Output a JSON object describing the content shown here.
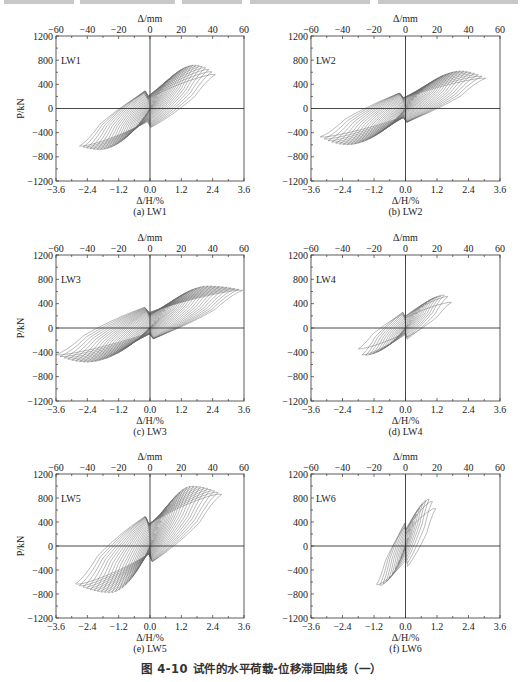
{
  "figure_caption": "图 4-10   试件的水平荷载-位移滞回曲线（一）",
  "chart_data": [
    {
      "type": "line",
      "subtype": "hysteresis",
      "panel_label": "(a) LW1",
      "specimen": "LW1",
      "xlabel": "Δ/H/%",
      "x2label": "Δ/mm",
      "ylabel": "P/kN",
      "xlim": [
        -3.6,
        3.6
      ],
      "x2lim": [
        -60,
        60
      ],
      "ylim": [
        -1200,
        1200
      ],
      "xticks": [
        "-3.6",
        "-2.4",
        "-1.2",
        "0.0",
        "1.2",
        "2.4",
        "3.6"
      ],
      "x2ticks": [
        "-60",
        "-40",
        "-20",
        "0",
        "20",
        "40",
        "60"
      ],
      "yticks": [
        "1200",
        "800",
        "400",
        "0",
        "-400",
        "-800",
        "-1200"
      ],
      "envelope": {
        "pos_drift_max": 2.5,
        "pos_peak_drift": 1.7,
        "pos_peak_load": 720,
        "pos_end_load": 560,
        "neg_drift_max": -2.7,
        "neg_peak_drift": -1.9,
        "neg_peak_load": -680,
        "neg_end_load": -620
      },
      "cycles": 22,
      "pinching": 0.55
    },
    {
      "type": "line",
      "subtype": "hysteresis",
      "panel_label": "(b) LW2",
      "specimen": "LW2",
      "xlabel": "Δ/H/%",
      "x2label": "Δ/mm",
      "ylabel": "P/kN",
      "xlim": [
        -3.6,
        3.6
      ],
      "x2lim": [
        -60,
        60
      ],
      "ylim": [
        -1200,
        1200
      ],
      "xticks": [
        "-3.6",
        "-2.4",
        "-1.2",
        "0.0",
        "1.2",
        "2.4",
        "3.6"
      ],
      "x2ticks": [
        "-60",
        "-40",
        "-20",
        "0",
        "20",
        "40",
        "60"
      ],
      "yticks": [
        "1200",
        "800",
        "400",
        "0",
        "-400",
        "-800",
        "-1200"
      ],
      "envelope": {
        "pos_drift_max": 3.05,
        "pos_peak_drift": 2.1,
        "pos_peak_load": 620,
        "pos_end_load": 500,
        "neg_drift_max": -3.25,
        "neg_peak_drift": -2.2,
        "neg_peak_load": -600,
        "neg_end_load": -470
      },
      "cycles": 24,
      "pinching": 0.6
    },
    {
      "type": "line",
      "subtype": "hysteresis",
      "panel_label": "(c) LW3",
      "specimen": "LW3",
      "xlabel": "Δ/H/%",
      "x2label": "Δ/mm",
      "ylabel": "P/kN",
      "xlim": [
        -3.6,
        3.6
      ],
      "x2lim": [
        -60,
        60
      ],
      "ylim": [
        -1200,
        1200
      ],
      "xticks": [
        "-3.6",
        "-2.4",
        "-1.2",
        "0.0",
        "1.2",
        "2.4",
        "3.6"
      ],
      "x2ticks": [
        "-60",
        "-40",
        "-20",
        "0",
        "20",
        "40",
        "60"
      ],
      "yticks": [
        "1200",
        "800",
        "400",
        "0",
        "-400",
        "-800",
        "-1200"
      ],
      "envelope": {
        "pos_drift_max": 3.55,
        "pos_peak_drift": 2.2,
        "pos_peak_load": 690,
        "pos_end_load": 620,
        "neg_drift_max": -3.6,
        "neg_peak_drift": -2.4,
        "neg_peak_load": -560,
        "neg_end_load": -440
      },
      "cycles": 26,
      "pinching": 0.6
    },
    {
      "type": "line",
      "subtype": "hysteresis",
      "panel_label": "(d) LW4",
      "specimen": "LW4",
      "xlabel": "Δ/H/%",
      "x2label": "Δ/mm",
      "ylabel": "P/kN",
      "xlim": [
        -3.6,
        3.6
      ],
      "x2lim": [
        -60,
        60
      ],
      "ylim": [
        -1200,
        1200
      ],
      "xticks": [
        "-3.6",
        "-2.4",
        "-1.2",
        "0.0",
        "1.2",
        "2.4",
        "3.6"
      ],
      "x2ticks": [
        "-60",
        "-40",
        "-20",
        "0",
        "20",
        "40",
        "60"
      ],
      "yticks": [
        "1200",
        "800",
        "400",
        "0",
        "-400",
        "-800",
        "-1200"
      ],
      "envelope": {
        "pos_drift_max": 1.75,
        "pos_peak_drift": 1.5,
        "pos_peak_load": 540,
        "pos_end_load": 420,
        "neg_drift_max": -1.8,
        "neg_peak_drift": -1.6,
        "neg_peak_load": -450,
        "neg_end_load": -340
      },
      "cycles": 14,
      "pinching": 0.5
    },
    {
      "type": "line",
      "subtype": "hysteresis",
      "panel_label": "(e) LW5",
      "specimen": "LW5",
      "xlabel": "Δ/H/%",
      "x2label": "Δ/mm",
      "ylabel": "P/kN",
      "xlim": [
        -3.6,
        3.6
      ],
      "x2lim": [
        -60,
        60
      ],
      "ylim": [
        -1200,
        1200
      ],
      "xticks": [
        "-3.6",
        "-2.4",
        "-1.2",
        "0.0",
        "1.2",
        "2.4",
        "3.6"
      ],
      "x2ticks": [
        "-60",
        "-40",
        "-20",
        "0",
        "20",
        "40",
        "60"
      ],
      "yticks": [
        "1200",
        "800",
        "400",
        "0",
        "-400",
        "-800",
        "-1200"
      ],
      "envelope": {
        "pos_drift_max": 2.75,
        "pos_peak_drift": 1.6,
        "pos_peak_load": 1000,
        "pos_end_load": 860,
        "neg_drift_max": -2.85,
        "neg_peak_drift": -1.5,
        "neg_peak_load": -780,
        "neg_end_load": -630
      },
      "cycles": 22,
      "pinching": 0.45
    },
    {
      "type": "line",
      "subtype": "hysteresis",
      "panel_label": "(f) LW6",
      "specimen": "LW6",
      "xlabel": "Δ/H/%",
      "x2label": "Δ/mm",
      "ylabel": "P/kN",
      "xlim": [
        -3.6,
        3.6
      ],
      "x2lim": [
        -60,
        60
      ],
      "ylim": [
        -1200,
        1200
      ],
      "xticks": [
        "-3.6",
        "-2.4",
        "-1.2",
        "0.0",
        "1.2",
        "2.4",
        "3.6"
      ],
      "x2ticks": [
        "-60",
        "-40",
        "-20",
        "0",
        "20",
        "40",
        "60"
      ],
      "yticks": [
        "1200",
        "800",
        "400",
        "0",
        "-400",
        "-800",
        "-1200"
      ],
      "envelope": {
        "pos_drift_max": 1.15,
        "pos_peak_drift": 0.9,
        "pos_peak_load": 780,
        "pos_end_load": 620,
        "neg_drift_max": -1.1,
        "neg_peak_drift": -1.05,
        "neg_peak_load": -660,
        "neg_end_load": -640
      },
      "cycles": 10,
      "pinching": 0.35
    }
  ],
  "layout": {
    "panels": [
      {
        "left": 56,
        "top": 36,
        "width": 188,
        "height": 145
      },
      {
        "left": 311,
        "top": 36,
        "width": 189,
        "height": 145
      },
      {
        "left": 56,
        "top": 255,
        "width": 188,
        "height": 146
      },
      {
        "left": 311,
        "top": 255,
        "width": 189,
        "height": 146
      },
      {
        "left": 56,
        "top": 474,
        "width": 188,
        "height": 144
      },
      {
        "left": 311,
        "top": 474,
        "width": 189,
        "height": 144
      }
    ],
    "curve_color": "#6a6a6a",
    "axis_color": "#333333"
  }
}
